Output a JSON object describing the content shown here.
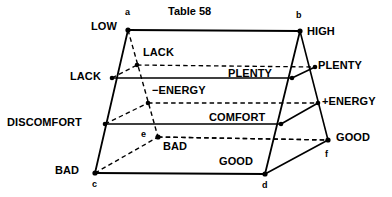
{
  "title": "Table 58",
  "colors": {
    "ink": "#000000",
    "background": "#ffffff"
  },
  "vertices": [
    {
      "id": "a",
      "label": "a",
      "x": 128,
      "y": 30
    },
    {
      "id": "b",
      "label": "b",
      "x": 300,
      "y": 31
    },
    {
      "id": "c",
      "label": "c",
      "x": 95,
      "y": 173
    },
    {
      "id": "d",
      "label": "d",
      "x": 265,
      "y": 174
    },
    {
      "id": "e",
      "label": "e",
      "x": 158,
      "y": 137
    },
    {
      "id": "f",
      "label": "f",
      "x": 328,
      "y": 140
    }
  ],
  "axis_labels": {
    "top_left": "LOW",
    "top_right": "HIGH",
    "upper_left": "LACK",
    "upper_right": "PLENTY",
    "mid_left": "DISCOMFORT",
    "mid_right": "+ENERGY",
    "bottom_left": "BAD",
    "bottom_right": "GOOD",
    "inner_lack": "LACK",
    "inner_plenty": "PLENTY",
    "inner_energy": "−ENERGY",
    "inner_comfort": "COMFORT",
    "inner_bad": "BAD",
    "inner_good": "GOOD"
  },
  "chart_data": {
    "type": "diagram",
    "title": "Table 58",
    "scales": [
      {
        "name": "level",
        "low": "LOW",
        "high": "HIGH"
      },
      {
        "name": "supply",
        "low": "LACK",
        "high": "PLENTY"
      },
      {
        "name": "energy",
        "low": "−ENERGY",
        "high": "+ENERGY"
      },
      {
        "name": "feeling",
        "low": "DISCOMFORT",
        "high": "COMFORT"
      },
      {
        "name": "valence",
        "low": "BAD",
        "high": "GOOD"
      }
    ],
    "front_face_vertices": [
      "a",
      "b",
      "d",
      "c"
    ],
    "rear_vertices": [
      "e",
      "f"
    ],
    "solid_rungs": [
      {
        "left_label": "LACK",
        "right_label": "PLENTY",
        "y": 78
      },
      {
        "left_label": "DISCOMFORT",
        "right_label": "COMFORT",
        "y": 124
      },
      {
        "left_label": "BAD",
        "right_label": "GOOD",
        "y": 173
      }
    ],
    "dashed_rungs": [
      {
        "left_label": "LACK",
        "right_label": "PLENTY",
        "y": 65
      },
      {
        "left_label": "−ENERGY",
        "right_label": "+ENERGY",
        "y": 103
      },
      {
        "left_label": "BAD",
        "right_label": "GOOD",
        "y": 137
      }
    ]
  },
  "labels": [
    {
      "key": "title",
      "text": "Table 58",
      "x": 168,
      "y": 6,
      "cls": "lbl-title"
    },
    {
      "key": "low",
      "text": "LOW",
      "x": 91,
      "y": 21,
      "cls": "lbl-main"
    },
    {
      "key": "high",
      "text": "HIGH",
      "x": 307,
      "y": 26,
      "cls": "lbl-main"
    },
    {
      "key": "inner-lack",
      "text": "LACK",
      "x": 143,
      "y": 47,
      "cls": "lbl-main"
    },
    {
      "key": "lack-left",
      "text": "LACK",
      "x": 70,
      "y": 71,
      "cls": "lbl-main"
    },
    {
      "key": "plenty-inner",
      "text": "PLENTY",
      "x": 228,
      "y": 68,
      "cls": "lbl-main"
    },
    {
      "key": "plenty-right",
      "text": "PLENTY",
      "x": 318,
      "y": 60,
      "cls": "lbl-main"
    },
    {
      "key": "neg-energy",
      "text": "−ENERGY",
      "x": 152,
      "y": 85,
      "cls": "lbl-main"
    },
    {
      "key": "pos-energy",
      "text": "+ENERGY",
      "x": 322,
      "y": 96,
      "cls": "lbl-main"
    },
    {
      "key": "discomfort",
      "text": "DISCOMFORT",
      "x": 7,
      "y": 117,
      "cls": "lbl-main"
    },
    {
      "key": "comfort",
      "text": "COMFORT",
      "x": 209,
      "y": 112,
      "cls": "lbl-main"
    },
    {
      "key": "good-right",
      "text": "GOOD",
      "x": 336,
      "y": 132,
      "cls": "lbl-main"
    },
    {
      "key": "inner-bad",
      "text": "BAD",
      "x": 163,
      "y": 141,
      "cls": "lbl-main"
    },
    {
      "key": "inner-good",
      "text": "GOOD",
      "x": 219,
      "y": 156,
      "cls": "lbl-main"
    },
    {
      "key": "bad-left",
      "text": "BAD",
      "x": 55,
      "y": 165,
      "cls": "lbl-main"
    },
    {
      "key": "vertex-a",
      "text": "a",
      "x": 125,
      "y": 8,
      "cls": "lbl-vertex"
    },
    {
      "key": "vertex-b",
      "text": "b",
      "x": 296,
      "y": 11,
      "cls": "lbl-vertex"
    },
    {
      "key": "vertex-c",
      "text": "c",
      "x": 92,
      "y": 180,
      "cls": "lbl-vertex"
    },
    {
      "key": "vertex-d",
      "text": "d",
      "x": 262,
      "y": 181,
      "cls": "lbl-vertex"
    },
    {
      "key": "vertex-e",
      "text": "e",
      "x": 141,
      "y": 130,
      "cls": "lbl-vertex"
    },
    {
      "key": "vertex-f",
      "text": "f",
      "x": 325,
      "y": 150,
      "cls": "lbl-vertex"
    }
  ]
}
